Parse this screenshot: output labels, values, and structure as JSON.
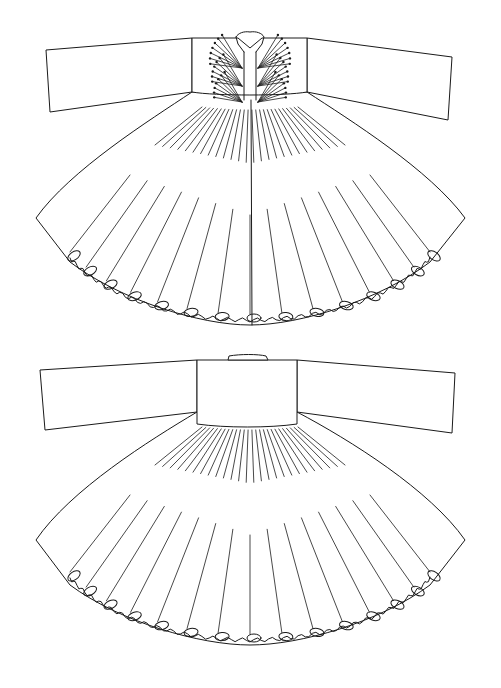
{
  "figure": {
    "background": "#ffffff",
    "stroke_color": "#1a1a1a",
    "views": [
      {
        "id": "front",
        "label": "",
        "body_top": 40,
        "waist_y": 105,
        "hem_y": 320,
        "center_x": 250,
        "sleeve_left": [
          [
            42,
            44
          ],
          [
            192,
            38
          ],
          [
            192,
            92
          ],
          [
            46,
            110
          ]
        ],
        "sleeve_right": [
          [
            307,
            38
          ],
          [
            455,
            56
          ],
          [
            452,
            125
          ],
          [
            307,
            92
          ]
        ],
        "bodice": [
          [
            192,
            38
          ],
          [
            307,
            38
          ],
          [
            307,
            92
          ],
          [
            192,
            92
          ]
        ],
        "collar_gap": [
          245,
          255
        ],
        "tassel_rows": [
          62,
          80,
          96
        ],
        "pleat_count": 14
      },
      {
        "id": "back",
        "label": "",
        "body_top": 358,
        "waist_y": 425,
        "hem_y": 640,
        "center_x": 250,
        "sleeve_left": [
          [
            40,
            370
          ],
          [
            197,
            360
          ],
          [
            197,
            412
          ],
          [
            45,
            430
          ]
        ],
        "sleeve_right": [
          [
            297,
            360
          ],
          [
            455,
            373
          ],
          [
            452,
            432
          ],
          [
            297,
            412
          ]
        ],
        "bodice": [
          [
            197,
            360
          ],
          [
            297,
            360
          ],
          [
            297,
            412
          ],
          [
            197,
            412
          ]
        ],
        "collar_tab": [
          [
            228,
            357
          ],
          [
            268,
            357
          ]
        ],
        "pleat_count": 14
      }
    ]
  }
}
